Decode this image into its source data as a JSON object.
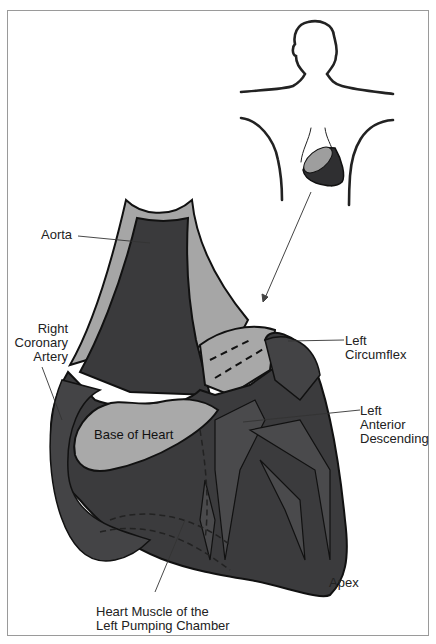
{
  "figure": {
    "colors": {
      "muscle": "#3a3a3c",
      "artery": "#48484a",
      "base": "#a9a9a9",
      "outline": "#111111",
      "background": "#ffffff",
      "frame": "#9a9a9a"
    }
  },
  "labels": {
    "aorta": "Aorta",
    "right_coronary_artery": "Right\nCoronary\nArtery",
    "left_circumflex": "Left\nCircumflex",
    "left_anterior_descending": "Left\nAnterior\nDescending",
    "base_of_heart": "Base of Heart",
    "apex": "Apex",
    "heart_muscle": "Heart Muscle of the\nLeft Pumping Chamber"
  },
  "inset": {
    "description": "Human figure outline with heart location in chest"
  }
}
